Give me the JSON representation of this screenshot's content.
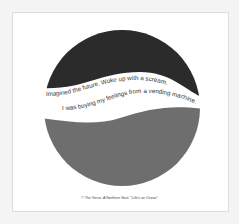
{
  "artwork": {
    "lyric_line_1": "Imagined the future. Woke up with a scream.",
    "lyric_line_2": "I was buying my feelings from a vending machine.",
    "colors": {
      "top": "#2b2b2b",
      "bottom": "#6e6e6e",
      "band": "#ffffff",
      "text": "#333333"
    }
  },
  "caption": "© The Verve, A Northern Soul, \"Life's an Ocean\""
}
